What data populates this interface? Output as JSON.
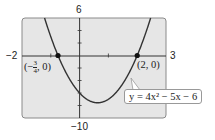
{
  "chart_data": {
    "type": "line",
    "title": "",
    "equation": "y = 4x^2 - 5x - 6",
    "xlabel": "",
    "ylabel": "",
    "xlim": [
      -2,
      3
    ],
    "ylim": [
      -10,
      6
    ],
    "grid": false,
    "x_tick_step": 1,
    "y_tick_step": 2,
    "series": [
      {
        "name": "y = 4x^2 - 5x - 6",
        "x": [
          -1.2,
          -1,
          -0.75,
          -0.5,
          0,
          0.3125,
          0.5,
          1,
          1.5,
          2,
          2.5
        ],
        "y": [
          5.76,
          3,
          0,
          -2.5,
          -6,
          -7.5625,
          -7.5,
          -7,
          -4.5,
          0,
          6.5
        ]
      }
    ],
    "points": [
      {
        "x": -0.75,
        "y": 0,
        "label": "(-3/4, 0)"
      },
      {
        "x": 2,
        "y": 0,
        "label": "(2, 0)"
      }
    ],
    "axis_labels": {
      "x_min": "-2",
      "x_max": "3",
      "y_max": "6",
      "y_min": "-10"
    }
  },
  "labels": {
    "x_min": "−2",
    "x_max": "3",
    "y_max": "6",
    "y_min": "−10",
    "point_left": "(−3/4, 0)",
    "point_right": "(2, 0)",
    "equation": "y = 4x² − 5x − 6"
  },
  "colors": {
    "frame_bg": "#e6e6e6",
    "frame_border": "#8a8a8a",
    "curve": "#333333",
    "axis": "#333333"
  }
}
